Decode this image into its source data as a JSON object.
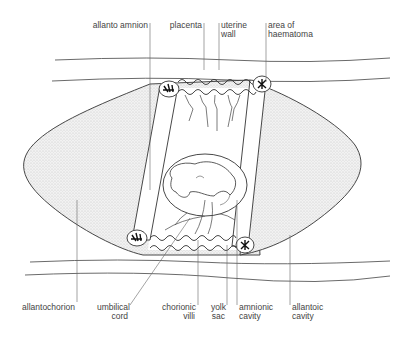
{
  "diagram": {
    "type": "anatomical cross-section",
    "colors": {
      "line": "#333333",
      "stipple": "#d9d9d9",
      "text": "#444444",
      "background": "#ffffff"
    }
  },
  "labels": {
    "top": [
      {
        "id": "allanto_amnion",
        "text": "allanto amnion"
      },
      {
        "id": "placenta",
        "text": "placenta"
      },
      {
        "id": "uterine_wall_1",
        "text": "uterine"
      },
      {
        "id": "uterine_wall_2",
        "text": "wall"
      },
      {
        "id": "haematoma_1",
        "text": "area of"
      },
      {
        "id": "haematoma_2",
        "text": "haematoma"
      }
    ],
    "bottom": [
      {
        "id": "allantochorion",
        "text": "allantochorion"
      },
      {
        "id": "umbilical_1",
        "text": "umbilical"
      },
      {
        "id": "umbilical_2",
        "text": "cord"
      },
      {
        "id": "chorionic_1",
        "text": "chorionic"
      },
      {
        "id": "chorionic_2",
        "text": "villi"
      },
      {
        "id": "yolk_1",
        "text": "yolk"
      },
      {
        "id": "yolk_2",
        "text": "sac"
      },
      {
        "id": "amnionic_1",
        "text": "amnionic"
      },
      {
        "id": "amnionic_2",
        "text": "cavity"
      },
      {
        "id": "allantoic_1",
        "text": "allantoic"
      },
      {
        "id": "allantoic_2",
        "text": "cavity"
      }
    ]
  }
}
